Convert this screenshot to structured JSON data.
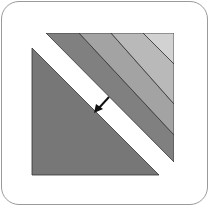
{
  "icon": {
    "name": "diagonal-offset-icon",
    "colors": {
      "frame_border": "#9a9a9a",
      "triangle": "#777777",
      "stripe1": "#808080",
      "stripe2": "#a3a3a3",
      "stripe3": "#b9b9b9",
      "stripe4": "#d2d2d2",
      "arrow": "#111111"
    }
  }
}
